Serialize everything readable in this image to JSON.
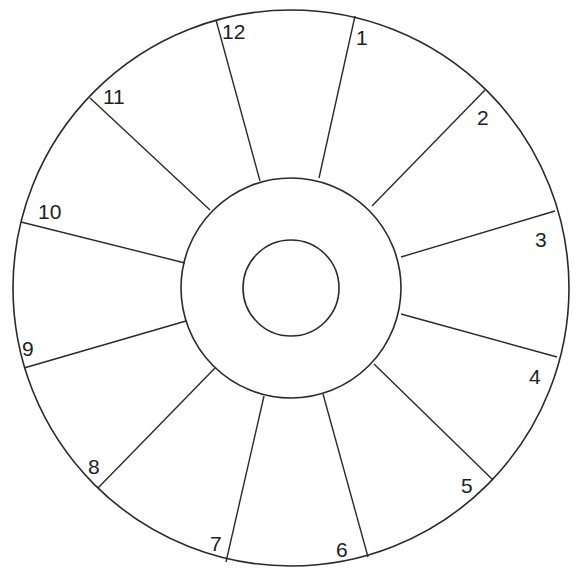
{
  "diagram": {
    "type": "twelve-segment wheel",
    "center": [
      291,
      288
    ],
    "rings": [
      {
        "name": "outer",
        "r": 278
      },
      {
        "name": "middle",
        "r": 110
      },
      {
        "name": "inner",
        "r": 48
      }
    ],
    "stroke_color": "#2a2a2a",
    "segments": [
      {
        "label": "1",
        "label_pos": [
          356,
          27
        ]
      },
      {
        "label": "2",
        "label_pos": [
          477,
          107
        ]
      },
      {
        "label": "3",
        "label_pos": [
          535,
          229
        ]
      },
      {
        "label": "4",
        "label_pos": [
          529,
          366
        ]
      },
      {
        "label": "5",
        "label_pos": [
          461,
          475
        ]
      },
      {
        "label": "6",
        "label_pos": [
          336,
          539
        ]
      },
      {
        "label": "7",
        "label_pos": [
          210,
          533
        ]
      },
      {
        "label": "8",
        "label_pos": [
          88,
          456
        ]
      },
      {
        "label": "9",
        "label_pos": [
          22,
          338
        ]
      },
      {
        "label": "10",
        "label_pos": [
          38,
          201
        ]
      },
      {
        "label": "11",
        "label_pos": [
          103,
          86
        ]
      },
      {
        "label": "12",
        "label_pos": [
          222,
          21
        ]
      }
    ],
    "spokes": [
      {
        "x1": 355,
        "y1": 16,
        "x2": 319,
        "y2": 178
      },
      {
        "x1": 485,
        "y1": 90,
        "x2": 372,
        "y2": 206
      },
      {
        "x1": 555,
        "y1": 211,
        "x2": 401,
        "y2": 257
      },
      {
        "x1": 557,
        "y1": 357,
        "x2": 401,
        "y2": 314
      },
      {
        "x1": 493,
        "y1": 480,
        "x2": 374,
        "y2": 364
      },
      {
        "x1": 368,
        "y1": 557,
        "x2": 323,
        "y2": 394
      },
      {
        "x1": 226,
        "y1": 562,
        "x2": 264,
        "y2": 396
      },
      {
        "x1": 98,
        "y1": 488,
        "x2": 215,
        "y2": 368
      },
      {
        "x1": 24,
        "y1": 368,
        "x2": 186,
        "y2": 321
      },
      {
        "x1": 21,
        "y1": 222,
        "x2": 185,
        "y2": 263
      },
      {
        "x1": 90,
        "y1": 98,
        "x2": 210,
        "y2": 210
      },
      {
        "x1": 216,
        "y1": 20,
        "x2": 260,
        "y2": 181
      }
    ]
  }
}
